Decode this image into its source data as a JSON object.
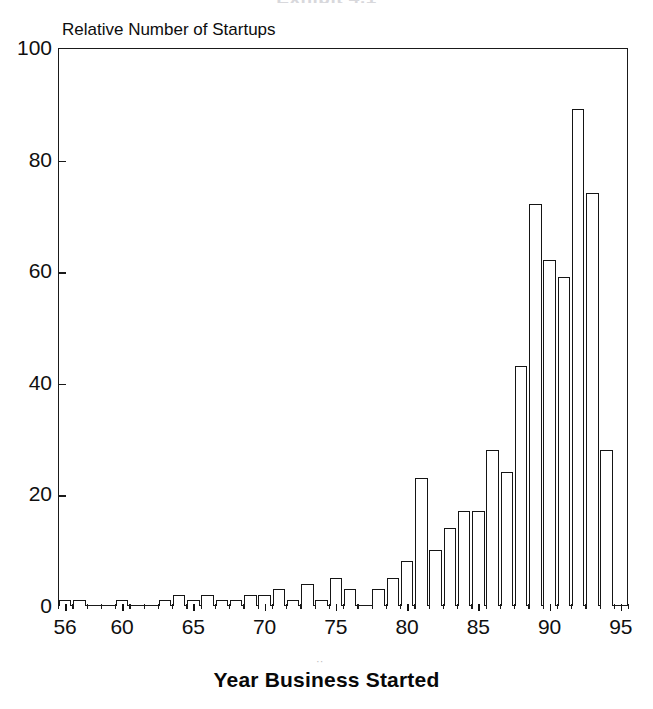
{
  "chart": {
    "title": "Exhibit 4.1",
    "y_axis_caption": "Relative Number of Startups",
    "x_axis_caption": "Year Business Started",
    "y_tick_labels": [
      "100",
      "80",
      "60",
      "40",
      "20",
      "0"
    ],
    "x_tick_labels": [
      "56",
      "60",
      "65",
      "70",
      "75",
      "80",
      "85",
      "90",
      "95"
    ],
    "frame_color": "#1a1a1a",
    "bar_fill_color": "#ffffff",
    "bar_edge_color": "#151515",
    "background_color": "#ffffff"
  },
  "chart_data": {
    "type": "bar",
    "title": "Exhibit 4.1",
    "xlabel": "Year Business Started",
    "ylabel": "Relative Number of Startups",
    "xlim": [
      55.5,
      95.5
    ],
    "ylim": [
      0,
      100
    ],
    "yticks": [
      0,
      20,
      40,
      60,
      80,
      100
    ],
    "xticks": [
      56,
      60,
      65,
      70,
      75,
      80,
      85,
      90,
      95
    ],
    "grid": false,
    "legend": "none",
    "categories": [
      "56",
      "57",
      "58",
      "59",
      "60",
      "61",
      "62",
      "63",
      "64",
      "65",
      "66",
      "67",
      "68",
      "69",
      "70",
      "71",
      "72",
      "73",
      "74",
      "75",
      "76",
      "77",
      "78",
      "79",
      "80",
      "81",
      "82",
      "83",
      "84",
      "85",
      "86",
      "87",
      "88",
      "89",
      "90",
      "91",
      "92",
      "93",
      "94",
      "95"
    ],
    "values": [
      1,
      1,
      0,
      0,
      1,
      0,
      0,
      1,
      2,
      1,
      2,
      1,
      1,
      2,
      2,
      3,
      1,
      4,
      1,
      5,
      3,
      0,
      3,
      5,
      8,
      23,
      10,
      14,
      17,
      17,
      28,
      24,
      43,
      72,
      62,
      59,
      89,
      74,
      28,
      0
    ]
  }
}
